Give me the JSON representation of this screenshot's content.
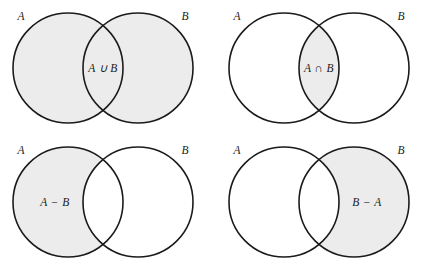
{
  "figure": {
    "background_color": "#ffffff",
    "stroke_color": "#1b1b1b",
    "shade_color": "#ececec",
    "label_color": "#1b1b1b"
  },
  "geometry": {
    "circle_radius": 55,
    "left_center_x": 68,
    "right_center_x": 138,
    "center_y": 68
  },
  "panels": [
    {
      "id": "union",
      "operation": "union",
      "op_label": "A ∪ B",
      "set_a_label": "A",
      "set_b_label": "B",
      "shaded_region": "both-circles"
    },
    {
      "id": "intersection",
      "operation": "intersection",
      "op_label": "A ∩ B",
      "set_a_label": "A",
      "set_b_label": "B",
      "shaded_region": "lens-only"
    },
    {
      "id": "a-minus-b",
      "operation": "difference-a-b",
      "op_label": "A − B",
      "set_a_label": "A",
      "set_b_label": "B",
      "shaded_region": "left-circle-minus-lens"
    },
    {
      "id": "b-minus-a",
      "operation": "difference-b-a",
      "op_label": "B − A",
      "set_a_label": "A",
      "set_b_label": "B",
      "shaded_region": "right-circle-minus-lens"
    }
  ]
}
